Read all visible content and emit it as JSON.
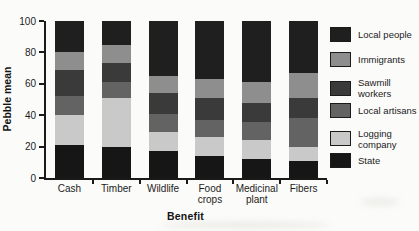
{
  "figure": {
    "background": "#fbfbf9",
    "axis_color": "#1a1a1a"
  },
  "chart_data": {
    "type": "bar",
    "stacked": true,
    "title": "",
    "xlabel": "Benefit",
    "ylabel": "Pebble mean",
    "ylim": [
      0,
      100
    ],
    "yticks": [
      0,
      20,
      40,
      60,
      80,
      100
    ],
    "grid": false,
    "legend_position": "right",
    "categories": [
      "Cash",
      "Timber",
      "Wildlife",
      "Food crops",
      "Medicinal plant",
      "Fibers"
    ],
    "category_label_lines": [
      [
        "Cash"
      ],
      [
        "Timber"
      ],
      [
        "Wildlife"
      ],
      [
        "Food",
        "crops"
      ],
      [
        "Medicinal",
        "plant"
      ],
      [
        "Fibers"
      ]
    ],
    "series": [
      {
        "name": "Local people",
        "label_lines": [
          "Local people"
        ],
        "color": "#1f1f1f",
        "values": [
          20,
          15,
          35,
          37,
          39,
          33
        ]
      },
      {
        "name": "Immigrants",
        "label_lines": [
          "Immigrants"
        ],
        "color": "#8e8e8e",
        "values": [
          11,
          12,
          11,
          12,
          13,
          16
        ]
      },
      {
        "name": "Sawmill workers",
        "label_lines": [
          "Sawmill",
          "workers"
        ],
        "color": "#3a3a3a",
        "values": [
          17,
          12,
          13,
          14,
          12,
          13
        ]
      },
      {
        "name": "Local artisans",
        "label_lines": [
          "Local artisans"
        ],
        "color": "#636363",
        "values": [
          12,
          10,
          12,
          11,
          12,
          18
        ]
      },
      {
        "name": "Logging company",
        "label_lines": [
          "Logging",
          "company"
        ],
        "color": "#c9c9c9",
        "values": [
          19,
          31,
          12,
          12,
          12,
          9
        ]
      },
      {
        "name": "State",
        "label_lines": [
          "State"
        ],
        "color": "#161616",
        "values": [
          21,
          20,
          17,
          14,
          12,
          11
        ]
      }
    ],
    "stack_order_bottom_to_top": [
      "State",
      "Logging company",
      "Local artisans",
      "Sawmill workers",
      "Immigrants",
      "Local people"
    ]
  }
}
